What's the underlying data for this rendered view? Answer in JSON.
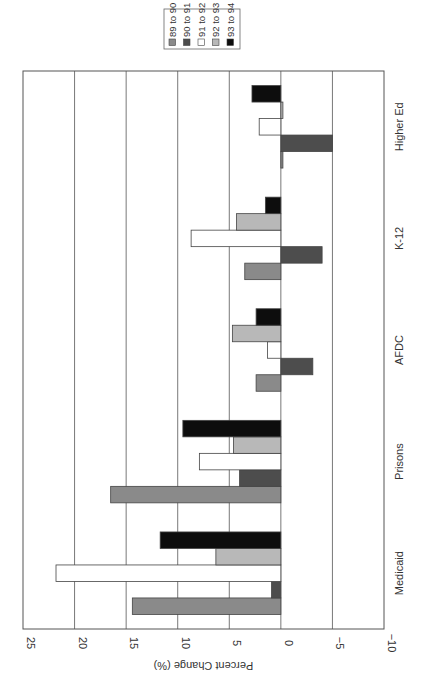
{
  "chart_data": {
    "type": "bar",
    "orientation": "horizontal bars, page rotated 90 degrees (categories read bottom-to-top, value axis left-to-right from 25 to -10)",
    "title": "",
    "xlabel": "",
    "ylabel": "Percent Change (%)",
    "categories": [
      "Medicaid",
      "Prisons",
      "AFDC",
      "K-12",
      "Higher Ed"
    ],
    "ylim": [
      -10,
      25
    ],
    "yticks": [
      25,
      20,
      15,
      10,
      5,
      0,
      -5,
      -10
    ],
    "ytick_labels": [
      "25",
      "20",
      "15",
      "10",
      "5",
      "0",
      "−5",
      "−10"
    ],
    "grid": true,
    "legend_position": "top-right (rotated)",
    "series": [
      {
        "name": "89 to 90",
        "color": "#8a8a8a",
        "values": [
          14.4,
          16.5,
          2.4,
          3.5,
          -0.2
        ]
      },
      {
        "name": "90 to 91",
        "color": "#4d4d4d",
        "values": [
          0.9,
          4.0,
          -3.1,
          -4.0,
          -5.0
        ]
      },
      {
        "name": "91 to 92",
        "color": "#ffffff",
        "values": [
          21.8,
          7.9,
          1.3,
          8.7,
          2.1
        ]
      },
      {
        "name": "92 to 93",
        "color": "#b8b8b8",
        "values": [
          6.3,
          4.6,
          4.7,
          4.3,
          -0.2
        ]
      },
      {
        "name": "93 to 94",
        "color": "#0d0d0d",
        "values": [
          11.7,
          9.5,
          2.4,
          1.5,
          2.8
        ]
      }
    ]
  },
  "legend": {
    "items": [
      {
        "label": "89 to 90",
        "color": "#8a8a8a"
      },
      {
        "label": "90 to 91",
        "color": "#4d4d4d"
      },
      {
        "label": "91 to 92",
        "color": "#ffffff"
      },
      {
        "label": "92 to 93",
        "color": "#b8b8b8"
      },
      {
        "label": "93 to 94",
        "color": "#0d0d0d"
      }
    ]
  }
}
